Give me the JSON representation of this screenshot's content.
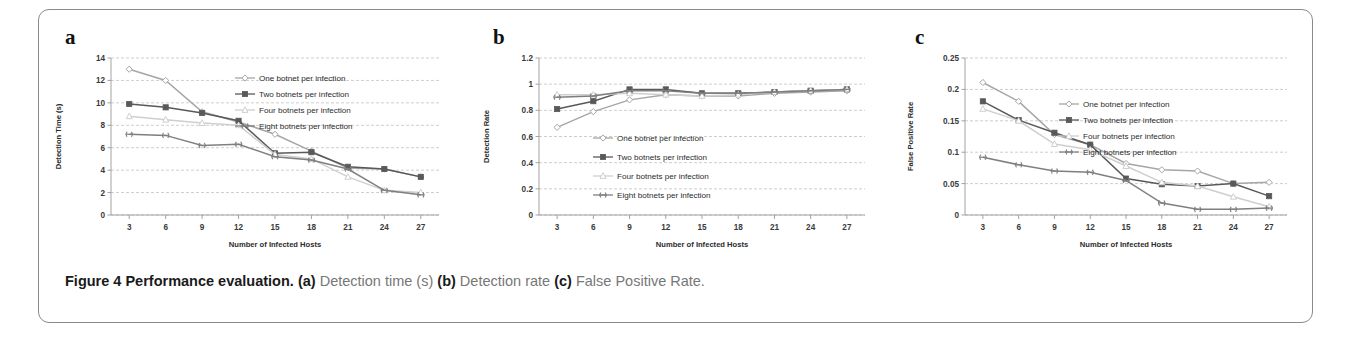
{
  "figure": {
    "caption_prefix": "Figure 4 Performance evaluation.",
    "caption_a_label": "(a)",
    "caption_a_text": "Detection time (s)",
    "caption_b_label": "(b)",
    "caption_b_text": "Detection rate",
    "caption_c_label": "(c)",
    "caption_c_text": "False Positive Rate.",
    "border_color": "#8b8b8b",
    "background": "#ffffff"
  },
  "series_meta": [
    {
      "name": "One botnet per infection",
      "color": "#a6a6a6",
      "marker": "diamond"
    },
    {
      "name": "Two botnets per infection",
      "color": "#595959",
      "marker": "square"
    },
    {
      "name": "Four botnets per infection",
      "color": "#cfcfcf",
      "marker": "triangle"
    },
    {
      "name": "Eight botnets per infection",
      "color": "#7f7f7f",
      "marker": "cross"
    }
  ],
  "chart_data": [
    {
      "id": "a",
      "panel_letter": "a",
      "type": "line",
      "title": "",
      "xlabel": "Number of Infected Hosts",
      "ylabel": "Detection Time (s)",
      "categories": [
        3,
        6,
        9,
        12,
        15,
        18,
        21,
        24,
        27
      ],
      "xtick_labels": [
        "3",
        "6",
        "9",
        "12",
        "15",
        "18",
        "21",
        "24",
        "27"
      ],
      "ylim": [
        0,
        14
      ],
      "yticks": [
        0,
        2,
        4,
        6,
        8,
        10,
        12,
        14
      ],
      "ytick_labels": [
        "0",
        "2",
        "4",
        "6",
        "8",
        "10",
        "12",
        "14"
      ],
      "grid": true,
      "legend_position": "top-right",
      "series": [
        {
          "name": "One botnet per infection",
          "values": [
            13.0,
            12.0,
            9.2,
            8.3,
            7.2,
            5.7,
            4.2,
            4.1,
            3.4
          ]
        },
        {
          "name": "Two botnets per infection",
          "values": [
            9.9,
            9.6,
            9.1,
            8.4,
            5.5,
            5.6,
            4.3,
            4.1,
            3.4
          ]
        },
        {
          "name": "Four botnets per infection",
          "values": [
            8.8,
            8.5,
            8.2,
            8.0,
            5.4,
            5.0,
            3.4,
            2.2,
            2.0
          ]
        },
        {
          "name": "Eight botnets per infection",
          "values": [
            7.2,
            7.1,
            6.2,
            6.3,
            5.2,
            4.9,
            4.1,
            2.2,
            1.8
          ]
        }
      ]
    },
    {
      "id": "b",
      "panel_letter": "b",
      "type": "line",
      "title": "",
      "xlabel": "Number of Infected Hosts",
      "ylabel": "Detection Rate",
      "categories": [
        3,
        6,
        9,
        12,
        15,
        18,
        21,
        24,
        27
      ],
      "xtick_labels": [
        "3",
        "6",
        "9",
        "12",
        "15",
        "18",
        "21",
        "24",
        "27"
      ],
      "ylim": [
        0,
        1.2
      ],
      "yticks": [
        0,
        0.2,
        0.4,
        0.6,
        0.8,
        1,
        1.2
      ],
      "ytick_labels": [
        "0",
        "0.2",
        "0.4",
        "0.6",
        "0.8",
        "1",
        "1.2"
      ],
      "grid": true,
      "legend_position": "center",
      "series": [
        {
          "name": "One botnet per infection",
          "values": [
            0.67,
            0.79,
            0.88,
            0.92,
            0.91,
            0.91,
            0.93,
            0.94,
            0.95
          ]
        },
        {
          "name": "Two botnets per infection",
          "values": [
            0.81,
            0.87,
            0.96,
            0.96,
            0.93,
            0.93,
            0.94,
            0.95,
            0.96
          ]
        },
        {
          "name": "Four botnets per infection",
          "values": [
            0.92,
            0.92,
            0.93,
            0.92,
            0.91,
            0.92,
            0.94,
            0.95,
            0.96
          ]
        },
        {
          "name": "Eight botnets per infection",
          "values": [
            0.9,
            0.91,
            0.95,
            0.95,
            0.93,
            0.93,
            0.94,
            0.95,
            0.96
          ]
        }
      ]
    },
    {
      "id": "c",
      "panel_letter": "c",
      "type": "line",
      "title": "",
      "xlabel": "Number of Infected Hosts",
      "ylabel": "False Positive Rate",
      "categories": [
        3,
        6,
        9,
        12,
        15,
        18,
        21,
        24,
        27
      ],
      "xtick_labels": [
        "3",
        "6",
        "9",
        "12",
        "15",
        "18",
        "21",
        "24",
        "27"
      ],
      "ylim": [
        0,
        0.25
      ],
      "yticks": [
        0,
        0.05,
        0.1,
        0.15,
        0.2,
        0.25
      ],
      "ytick_labels": [
        "0",
        "0.05",
        "0.1",
        "0.15",
        "0.2",
        "0.25"
      ],
      "grid": true,
      "legend_position": "top-right",
      "series": [
        {
          "name": "One botnet per infection",
          "values": [
            0.211,
            0.181,
            0.128,
            0.112,
            0.082,
            0.072,
            0.07,
            0.05,
            0.052
          ]
        },
        {
          "name": "Two botnets per infection",
          "values": [
            0.181,
            0.151,
            0.131,
            0.112,
            0.058,
            0.049,
            0.046,
            0.05,
            0.03
          ]
        },
        {
          "name": "Four botnets per infection",
          "values": [
            0.169,
            0.15,
            0.113,
            0.104,
            0.078,
            0.052,
            0.046,
            0.029,
            0.013
          ]
        },
        {
          "name": "Eight botnets per infection",
          "values": [
            0.092,
            0.08,
            0.07,
            0.068,
            0.055,
            0.019,
            0.009,
            0.009,
            0.011
          ]
        }
      ]
    }
  ]
}
